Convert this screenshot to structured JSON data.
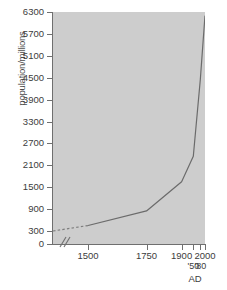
{
  "chart_data": {
    "type": "line",
    "title": "",
    "xlabel": "AD",
    "ylabel": "population/millions",
    "grid": false,
    "legend": "none",
    "xlim": [
      1350,
      2000
    ],
    "ylim": [
      0,
      6300
    ],
    "y_ticks": [
      0,
      300,
      900,
      1500,
      2100,
      2700,
      3300,
      3900,
      4500,
      5100,
      5700,
      6300
    ],
    "y_tick_labels": [
      "0",
      "300",
      "900",
      "1500",
      "2100",
      "2700",
      "3300",
      "3900",
      "4500",
      "5100",
      "5700",
      "6300"
    ],
    "y_axis_break": true,
    "x_axis_break": true,
    "x_ticks": [
      1500,
      1750,
      1900,
      1950,
      1980,
      2000
    ],
    "x_tick_labels": [
      "1500",
      "1750",
      "1900",
      "'50",
      "'80",
      "2000"
    ],
    "x_minor_labels": [
      "'50",
      "'80"
    ],
    "series": [
      {
        "name": "world population",
        "style": "dashed-then-solid",
        "x": [
          1350,
          1500,
          1750,
          1900,
          1950,
          1980,
          2000
        ],
        "y": [
          300,
          450,
          850,
          1650,
          2350,
          4450,
          6200
        ],
        "dashed_segment_x": [
          1350,
          1500
        ],
        "dashed_segment_y": [
          300,
          450
        ]
      }
    ],
    "annotations": []
  },
  "axes": {
    "y_title": "population/millions",
    "x_title": "AD"
  },
  "colors": {
    "plot_background": "#cdcdcd",
    "page_background": "#ffffff",
    "axis": "#6f6f6f",
    "curve": "#6b6b6b",
    "tick_text": "#3c3c3c"
  }
}
